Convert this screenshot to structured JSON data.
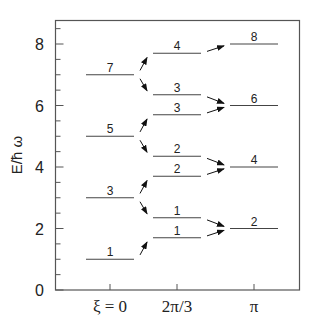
{
  "chart_data": {
    "type": "scatter",
    "title": "",
    "xlabel": "",
    "ylabel": "E/ħ ω",
    "ylim": [
      0,
      8.8
    ],
    "yticks": [
      0,
      2,
      4,
      6,
      8
    ],
    "categories": [
      "ξ = 0",
      "2π/3",
      "π"
    ],
    "grid": false,
    "legend": null,
    "series": [
      {
        "name": "ξ = 0",
        "levels": [
          {
            "E": 1,
            "label": "1"
          },
          {
            "E": 3,
            "label": "3"
          },
          {
            "E": 5,
            "label": "5"
          },
          {
            "E": 7,
            "label": "7"
          }
        ]
      },
      {
        "name": "2π/3",
        "levels": [
          {
            "E": 1.7,
            "label": "1"
          },
          {
            "E": 2.35,
            "label": "1"
          },
          {
            "E": 3.7,
            "label": "2"
          },
          {
            "E": 4.35,
            "label": "2"
          },
          {
            "E": 5.7,
            "label": "3"
          },
          {
            "E": 6.35,
            "label": "3"
          },
          {
            "E": 7.7,
            "label": "4"
          }
        ]
      },
      {
        "name": "π",
        "levels": [
          {
            "E": 2,
            "label": "2"
          },
          {
            "E": 4,
            "label": "4"
          },
          {
            "E": 6,
            "label": "6"
          },
          {
            "E": 8,
            "label": "8"
          }
        ]
      }
    ],
    "arrows": [
      {
        "from": [
          0,
          1
        ],
        "to": [
          1,
          1.7
        ]
      },
      {
        "from": [
          0,
          3
        ],
        "to": [
          1,
          2.35
        ]
      },
      {
        "from": [
          0,
          3
        ],
        "to": [
          1,
          3.7
        ]
      },
      {
        "from": [
          0,
          5
        ],
        "to": [
          1,
          4.35
        ]
      },
      {
        "from": [
          0,
          5
        ],
        "to": [
          1,
          5.7
        ]
      },
      {
        "from": [
          0,
          7
        ],
        "to": [
          1,
          6.35
        ]
      },
      {
        "from": [
          0,
          7
        ],
        "to": [
          1,
          7.7
        ]
      },
      {
        "from": [
          1,
          1.7
        ],
        "to": [
          2,
          2
        ]
      },
      {
        "from": [
          1,
          2.35
        ],
        "to": [
          2,
          2
        ]
      },
      {
        "from": [
          1,
          3.7
        ],
        "to": [
          2,
          4
        ]
      },
      {
        "from": [
          1,
          4.35
        ],
        "to": [
          2,
          4
        ]
      },
      {
        "from": [
          1,
          5.7
        ],
        "to": [
          2,
          6
        ]
      },
      {
        "from": [
          1,
          6.35
        ],
        "to": [
          2,
          6
        ]
      },
      {
        "from": [
          1,
          7.7
        ],
        "to": [
          2,
          8
        ]
      }
    ]
  }
}
